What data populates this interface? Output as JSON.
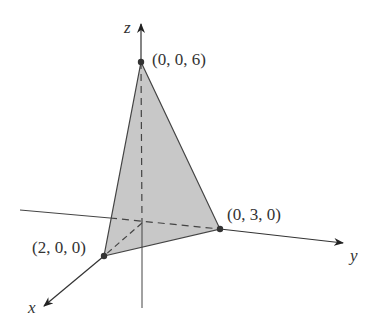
{
  "diagram": {
    "type": "3d-tetrahedron-plane",
    "axes": {
      "x": "x",
      "y": "y",
      "z": "z"
    },
    "points": [
      {
        "label": "(0, 0, 6)"
      },
      {
        "label": "(0, 3, 0)"
      },
      {
        "label": "(2, 0, 0)"
      }
    ],
    "colors": {
      "fill": "#c8c8c8",
      "line": "#444444",
      "point": "#333333"
    }
  }
}
